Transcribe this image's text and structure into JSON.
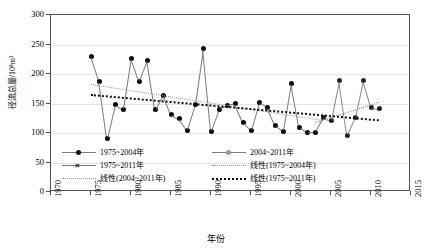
{
  "chart_data": {
    "type": "line",
    "title": "",
    "xlabel": "年份",
    "ylabel": "径流总量/10⁸m³",
    "xlim": [
      1970,
      2015
    ],
    "ylim": [
      0,
      300
    ],
    "xticks": [
      "1970",
      "1975",
      "1980",
      "1985",
      "1990",
      "1995",
      "2000",
      "2005",
      "2010",
      "2015"
    ],
    "yticks": [
      "0",
      "50",
      "100",
      "150",
      "200",
      "250",
      "300"
    ],
    "grid": true,
    "legend_position": "bottom",
    "x": [
      1975,
      1976,
      1977,
      1978,
      1979,
      1980,
      1981,
      1982,
      1983,
      1984,
      1985,
      1986,
      1987,
      1988,
      1989,
      1990,
      1991,
      1992,
      1993,
      1994,
      1995,
      1996,
      1997,
      1998,
      1999,
      2000,
      2001,
      2002,
      2003,
      2004,
      2005,
      2006,
      2007,
      2008,
      2009,
      2010,
      2011
    ],
    "series": [
      {
        "name": "1975~2004年",
        "marker": "circle",
        "values": [
          230,
          188,
          90,
          148,
          140,
          227,
          188,
          223,
          139,
          164,
          131,
          124,
          105,
          148,
          243,
          103,
          140,
          147,
          150,
          118,
          104,
          152,
          144,
          113,
          103,
          184,
          110,
          101,
          101,
          126,
          null,
          null,
          null,
          null,
          null,
          null,
          null
        ]
      },
      {
        "name": "2004~2011年",
        "marker": "circle",
        "values": [
          null,
          null,
          null,
          null,
          null,
          null,
          null,
          null,
          null,
          null,
          null,
          null,
          null,
          null,
          null,
          null,
          null,
          null,
          null,
          null,
          null,
          null,
          null,
          null,
          null,
          null,
          null,
          null,
          null,
          126,
          121,
          189,
          96,
          126,
          189,
          143,
          141
        ]
      },
      {
        "name": "1975~2011年",
        "marker": "x",
        "values": [
          230,
          188,
          90,
          148,
          140,
          227,
          188,
          223,
          139,
          164,
          131,
          124,
          105,
          148,
          243,
          103,
          140,
          147,
          150,
          118,
          104,
          152,
          144,
          113,
          103,
          184,
          110,
          101,
          101,
          126,
          121,
          189,
          96,
          126,
          189,
          143,
          141
        ]
      }
    ],
    "trendlines": [
      {
        "name": "线性(1975~2004年)",
        "style": "dotted-light",
        "x0": 1975,
        "y0": 183,
        "x1": 2004,
        "y1": 122
      },
      {
        "name": "线性(2004~2011年)",
        "style": "dotted-mid",
        "x0": 2003,
        "y0": 118,
        "x1": 2011,
        "y1": 152
      },
      {
        "name": "线性(1975~2011年)",
        "style": "dotted-dark",
        "x0": 1975,
        "y0": 166,
        "x1": 2011,
        "y1": 123
      }
    ],
    "legend": [
      {
        "label": "1975~2004年",
        "key": "line-dot"
      },
      {
        "label": "2004~2011年",
        "key": "line-dot-grey"
      },
      {
        "label": "1975~2011年",
        "key": "line-x"
      },
      {
        "label": "线性(1975~2004年)",
        "key": "dotted-light"
      },
      {
        "label": "线性(2004~2011年)",
        "key": "dotted-mid"
      },
      {
        "label": "线性(1975~2011年)",
        "key": "dotted-dark"
      }
    ]
  }
}
